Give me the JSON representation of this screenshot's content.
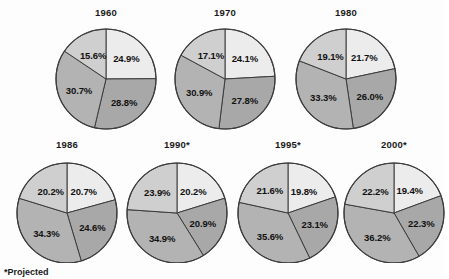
{
  "footnote": "*Projected",
  "colors": {
    "slice1": "#ececec",
    "slice2": "#a8a8a8",
    "slice3": "#b3b3b3",
    "slice4": "#cfcfcf",
    "outline": "#3c3c3c",
    "background": "#fdfdfd",
    "text": "#111111"
  },
  "chart_data": {
    "type": "pie",
    "title": "",
    "subtitle": "",
    "xlabel": "",
    "ylabel": "",
    "legend_position": "none",
    "grid": false,
    "annotations": [
      "*Projected"
    ],
    "series_names": [
      "Segment 1",
      "Segment 2",
      "Segment 3",
      "Segment 4"
    ],
    "units": "percent",
    "charts": [
      {
        "title": "1960",
        "projected": false,
        "labels": [
          "24.9%",
          "28.8%",
          "30.7%",
          "15.6%"
        ],
        "values": [
          24.9,
          28.8,
          30.7,
          15.6
        ]
      },
      {
        "title": "1970",
        "projected": false,
        "labels": [
          "24.1%",
          "27.8%",
          "30.9%",
          "17.1%"
        ],
        "values": [
          24.1,
          27.8,
          30.9,
          17.1
        ]
      },
      {
        "title": "1980",
        "projected": false,
        "labels": [
          "21.7%",
          "26.0%",
          "33.3%",
          "19.1%"
        ],
        "values": [
          21.7,
          26.0,
          33.3,
          19.1
        ]
      },
      {
        "title": "1986",
        "projected": false,
        "labels": [
          "20.7%",
          "24.6%",
          "34.3%",
          "20.2%"
        ],
        "values": [
          20.7,
          24.6,
          34.3,
          20.2
        ]
      },
      {
        "title": "1990*",
        "projected": true,
        "labels": [
          "20.2%",
          "20.9%",
          "34.9%",
          "23.9%"
        ],
        "values": [
          20.2,
          20.9,
          34.9,
          23.9
        ]
      },
      {
        "title": "1995*",
        "projected": true,
        "labels": [
          "19.8%",
          "23.1%",
          "35.6%",
          "21.6%"
        ],
        "values": [
          19.8,
          23.1,
          35.6,
          21.6
        ]
      },
      {
        "title": "2000*",
        "projected": true,
        "labels": [
          "19.4%",
          "22.3%",
          "36.2%",
          "22.2%"
        ],
        "values": [
          19.4,
          22.3,
          36.2,
          22.2
        ]
      }
    ]
  }
}
